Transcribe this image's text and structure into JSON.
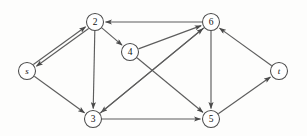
{
  "figure": {
    "type": "directed-graph",
    "title": "",
    "width": 307,
    "height": 136,
    "background_color": "#fdfdfc",
    "node_fill_color": "#ffffff",
    "node_stroke_color": "#4a4a4a",
    "edge_color": "#5d5d5d",
    "label_color": "#111111",
    "node_radius": 8.5
  },
  "nodes": [
    {
      "id": "s",
      "label": "s",
      "x": 27,
      "y": 71,
      "style": "italic"
    },
    {
      "id": "2",
      "label": "2",
      "x": 95,
      "y": 22,
      "style": "normal"
    },
    {
      "id": "3",
      "label": "3",
      "x": 93,
      "y": 119,
      "style": "normal"
    },
    {
      "id": "4",
      "label": "4",
      "x": 130,
      "y": 52,
      "style": "normal"
    },
    {
      "id": "5",
      "label": "5",
      "x": 211,
      "y": 119,
      "style": "normal"
    },
    {
      "id": "6",
      "label": "6",
      "x": 211,
      "y": 22,
      "style": "normal"
    },
    {
      "id": "t",
      "label": "t",
      "x": 279,
      "y": 71,
      "style": "italic"
    }
  ],
  "edges": [
    {
      "from": "s",
      "to": "2",
      "name": "edge-s-2",
      "offset": -1.6
    },
    {
      "from": "2",
      "to": "s",
      "name": "edge-2-s",
      "offset": -1.6
    },
    {
      "from": "s",
      "to": "3",
      "name": "edge-s-3",
      "offset": 0
    },
    {
      "from": "2",
      "to": "3",
      "name": "edge-2-3",
      "offset": 0
    },
    {
      "from": "2",
      "to": "4",
      "name": "edge-2-4",
      "offset": 0
    },
    {
      "from": "4",
      "to": "6",
      "name": "edge-4-6",
      "offset": 0
    },
    {
      "from": "4",
      "to": "5",
      "name": "edge-4-5",
      "offset": 0
    },
    {
      "from": "6",
      "to": "2",
      "name": "edge-6-2",
      "offset": 0
    },
    {
      "from": "6",
      "to": "3",
      "name": "edge-6-3",
      "offset": 0
    },
    {
      "from": "6",
      "to": "5",
      "name": "edge-6-5",
      "offset": 0
    },
    {
      "from": "3",
      "to": "6",
      "name": "edge-3-6",
      "offset": 0
    },
    {
      "from": "3",
      "to": "5",
      "name": "edge-3-5",
      "offset": 0
    },
    {
      "from": "5",
      "to": "t",
      "name": "edge-5-t",
      "offset": 0
    },
    {
      "from": "t",
      "to": "6",
      "name": "edge-t-6",
      "offset": 0
    }
  ]
}
